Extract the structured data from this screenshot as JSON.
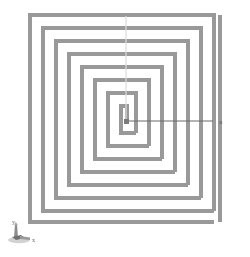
{
  "viewport": {
    "background_color": "#ffffff",
    "name": "cad-model-viewport"
  },
  "geometry": {
    "name": "rectangular-spiral",
    "type": "square-spiral-polyline",
    "stroke_color": "#999999",
    "stroke_highlight_color": "#b5b5b5",
    "stroke_width": 4,
    "turns": 8,
    "ring_spacing": 13,
    "outer_bounds": {
      "left": 30,
      "top": 15,
      "right": 214,
      "bottom": 222
    },
    "center": {
      "x": 126,
      "y": 121
    }
  },
  "axes": {
    "x_axis": {
      "label": "x",
      "color": "#6b6b6b",
      "start": {
        "x": 126,
        "y": 121
      },
      "end": {
        "x": 213,
        "y": 121
      },
      "label_position": {
        "x": 219,
        "y": 124
      }
    },
    "y_axis": {
      "label": "y",
      "color": "#d8d8d8",
      "start": {
        "x": 126,
        "y": 121
      },
      "end": {
        "x": 126,
        "y": 16
      }
    },
    "origin_marker": {
      "name": "origin-point",
      "color": "#7a7a7a",
      "x": 126,
      "y": 121,
      "size": 4
    }
  },
  "axis_triad": {
    "name": "axis-triad-indicator",
    "position": {
      "x": 8,
      "y": 222
    },
    "x_label": "x",
    "y_label": "y",
    "body_color": "#8c8c8c",
    "shadow_color": "#c9c9c9",
    "label_color": "#6e6e6e"
  },
  "outer_tail_bar": {
    "name": "spiral-outer-tail",
    "x": 220,
    "top": 15,
    "bottom": 222,
    "width": 4,
    "color": "#999999"
  }
}
